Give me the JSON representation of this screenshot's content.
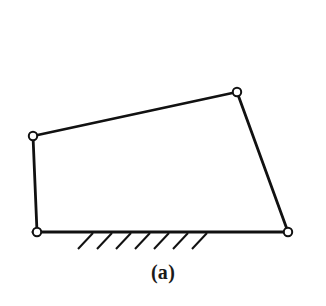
{
  "figure": {
    "caption": "(a)",
    "background_color": "#ffffff",
    "stroke_color": "#111111",
    "joint_fill_color": "#ffffff",
    "width": 326,
    "height": 306
  },
  "chart_data": {
    "type": "diagram",
    "title": "(a)",
    "subtitle": "",
    "coordinate_system": "pixels, origin top-left",
    "xlim": [
      0,
      326
    ],
    "ylim": [
      0,
      306
    ],
    "grid": false,
    "legend": null,
    "joints": [
      {
        "id": "A",
        "name": "top-left-joint",
        "x": 33,
        "y": 136,
        "radius": 4.2,
        "type": "revolute-pin"
      },
      {
        "id": "B",
        "name": "top-right-joint",
        "x": 237,
        "y": 92,
        "radius": 4.2,
        "type": "revolute-pin"
      },
      {
        "id": "C",
        "name": "bottom-right-joint",
        "x": 288,
        "y": 232,
        "radius": 4.2,
        "type": "revolute-pin-grounded"
      },
      {
        "id": "D",
        "name": "bottom-left-joint",
        "x": 37,
        "y": 232,
        "radius": 4.2,
        "type": "revolute-pin-grounded"
      }
    ],
    "links": [
      {
        "id": "L1",
        "name": "top-link",
        "from": "A",
        "to": "B",
        "x1": 33,
        "y1": 136,
        "x2": 237,
        "y2": 92,
        "stroke_width": 2.8
      },
      {
        "id": "L2",
        "name": "right-link",
        "from": "B",
        "to": "C",
        "x1": 237,
        "y1": 92,
        "x2": 288,
        "y2": 232,
        "stroke_width": 2.8
      },
      {
        "id": "L3",
        "name": "ground-link",
        "from": "D",
        "to": "C",
        "x1": 33,
        "y1": 232,
        "x2": 291,
        "y2": 232,
        "stroke_width": 3.0
      },
      {
        "id": "L4",
        "name": "left-link",
        "from": "D",
        "to": "A",
        "x1": 37,
        "y1": 232,
        "x2": 33,
        "y2": 136,
        "stroke_width": 2.8
      }
    ],
    "ground_hatching": {
      "count": 7,
      "angle_deg": 47,
      "stroke_width": 2.0,
      "marks": [
        {
          "x1": 93,
          "y1": 233,
          "x2": 78,
          "y2": 249
        },
        {
          "x1": 112,
          "y1": 233,
          "x2": 97,
          "y2": 249
        },
        {
          "x1": 131,
          "y1": 233,
          "x2": 116,
          "y2": 249
        },
        {
          "x1": 150,
          "y1": 233,
          "x2": 135,
          "y2": 249
        },
        {
          "x1": 169,
          "y1": 233,
          "x2": 154,
          "y2": 249
        },
        {
          "x1": 188,
          "y1": 233,
          "x2": 173,
          "y2": 249
        },
        {
          "x1": 207,
          "y1": 233,
          "x2": 192,
          "y2": 249
        }
      ]
    },
    "annotations": [
      {
        "name": "figure-caption",
        "text": "(a)",
        "x": 165,
        "y": 278
      }
    ]
  }
}
